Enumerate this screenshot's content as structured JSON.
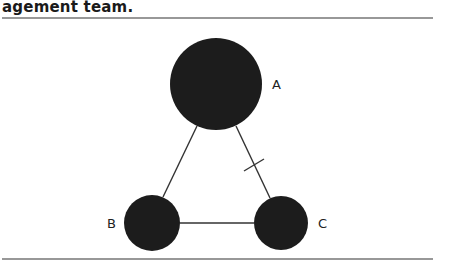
{
  "caption": {
    "text": "agement team."
  },
  "diagram": {
    "nodes": [
      {
        "id": "A",
        "label": "A",
        "cx": 216,
        "cy": 84,
        "r": 46
      },
      {
        "id": "B",
        "label": "B",
        "cx": 152,
        "cy": 223,
        "r": 28
      },
      {
        "id": "C",
        "label": "C",
        "cx": 281,
        "cy": 223,
        "r": 27
      }
    ],
    "edges": [
      {
        "from": "A",
        "to": "B",
        "marked": false
      },
      {
        "from": "A",
        "to": "C",
        "marked": true
      },
      {
        "from": "B",
        "to": "C",
        "marked": false
      }
    ],
    "colors": {
      "node": "#1c1c1c",
      "edge": "#333333",
      "rule": "#333333"
    }
  }
}
